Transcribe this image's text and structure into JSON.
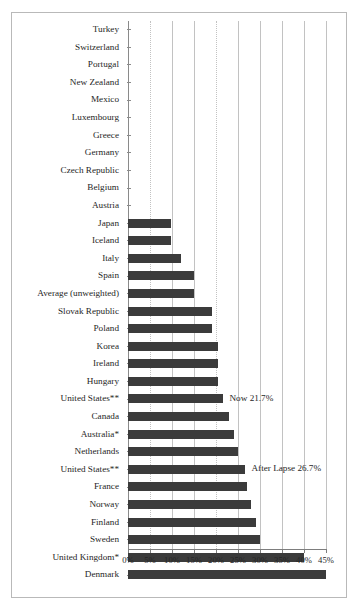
{
  "chart_data": {
    "type": "bar",
    "orientation": "horizontal",
    "title": "",
    "subtitle": "",
    "xlabel": "",
    "ylabel": "",
    "xlim": [
      0,
      45
    ],
    "grid": true,
    "legend": "none",
    "xticks": [
      "0%",
      "5%",
      "10%",
      "15%",
      "20%",
      "25%",
      "30%",
      "35%",
      "40%",
      "45%"
    ],
    "xtick_values": [
      0,
      5,
      10,
      15,
      20,
      25,
      30,
      35,
      40,
      45
    ],
    "categories": [
      "Turkey",
      "Switzerland",
      "Portugal",
      "New Zealand",
      "Mexico",
      "Luxembourg",
      "Greece",
      "Germany",
      "Czech Republic",
      "Belgium",
      "Austria",
      "Japan",
      "Iceland",
      "Italy",
      "Spain",
      "Average (unweighted)",
      "Slovak Republic",
      "Poland",
      "Korea",
      "Ireland",
      "Hungary",
      "United States**",
      "Canada",
      "Australia*",
      "Netherlands",
      "United States**",
      "France",
      "Norway",
      "Finland",
      "Sweden",
      "United Kingdom*",
      "Denmark"
    ],
    "values": [
      0,
      0,
      0,
      0,
      0,
      0,
      0,
      0,
      0,
      0,
      0,
      9.7,
      9.7,
      12.0,
      15.0,
      15.0,
      19.0,
      19.0,
      20.5,
      20.5,
      20.5,
      21.7,
      23.0,
      24.0,
      25.0,
      26.7,
      27.0,
      28.0,
      29.0,
      30.0,
      40.0,
      45.0
    ],
    "annotations": [
      {
        "label": "Now 21.7%",
        "category": "United States**",
        "value": 21.7,
        "row": 21
      },
      {
        "label": "After Lapse 26.7%",
        "category": "United States**",
        "value": 26.7,
        "row": 25
      }
    ],
    "bar_color": "#3b3b3b",
    "grid_color": "#c2c2c2",
    "axis_color": "#7d7d7d"
  }
}
